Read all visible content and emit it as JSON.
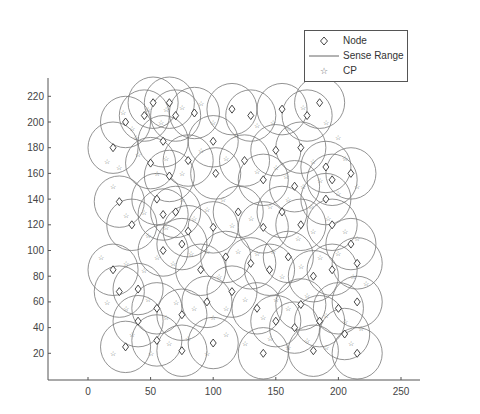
{
  "chart_data": {
    "type": "scatter",
    "title": "",
    "xlabel": "",
    "ylabel": "",
    "xlim": [
      -31,
      265
    ],
    "ylim": [
      0,
      235
    ],
    "grid": false,
    "legend_position": "top-right",
    "x_ticks": [
      0,
      50,
      100,
      150,
      200,
      250
    ],
    "y_ticks": [
      20,
      40,
      60,
      80,
      100,
      120,
      140,
      160,
      180,
      200,
      220
    ],
    "sense_range_radius": 20,
    "legend": [
      {
        "label": "Node",
        "marker": "diamond"
      },
      {
        "label": "Sense Range",
        "marker": "line"
      },
      {
        "label": "CP",
        "marker": "star"
      }
    ],
    "series": [
      {
        "name": "Node",
        "marker": "diamond",
        "points": [
          [
            30,
            200
          ],
          [
            45,
            205
          ],
          [
            52,
            215
          ],
          [
            65,
            215
          ],
          [
            70,
            205
          ],
          [
            60,
            185
          ],
          [
            85,
            207
          ],
          [
            20,
            180
          ],
          [
            50,
            168
          ],
          [
            65,
            158
          ],
          [
            80,
            170
          ],
          [
            100,
            185
          ],
          [
            102,
            160
          ],
          [
            115,
            210
          ],
          [
            130,
            205
          ],
          [
            155,
            210
          ],
          [
            175,
            205
          ],
          [
            185,
            215
          ],
          [
            150,
            178
          ],
          [
            170,
            180
          ],
          [
            190,
            165
          ],
          [
            125,
            170
          ],
          [
            140,
            155
          ],
          [
            165,
            150
          ],
          [
            195,
            155
          ],
          [
            210,
            160
          ],
          [
            190,
            140
          ],
          [
            25,
            138
          ],
          [
            35,
            120
          ],
          [
            55,
            140
          ],
          [
            60,
            128
          ],
          [
            70,
            130
          ],
          [
            80,
            115
          ],
          [
            100,
            118
          ],
          [
            120,
            130
          ],
          [
            140,
            118
          ],
          [
            155,
            130
          ],
          [
            170,
            120
          ],
          [
            195,
            120
          ],
          [
            210,
            105
          ],
          [
            20,
            85
          ],
          [
            40,
            70
          ],
          [
            25,
            68
          ],
          [
            60,
            100
          ],
          [
            75,
            105
          ],
          [
            90,
            85
          ],
          [
            110,
            95
          ],
          [
            130,
            90
          ],
          [
            145,
            85
          ],
          [
            160,
            95
          ],
          [
            180,
            80
          ],
          [
            195,
            85
          ],
          [
            215,
            90
          ],
          [
            40,
            45
          ],
          [
            55,
            55
          ],
          [
            75,
            50
          ],
          [
            95,
            60
          ],
          [
            115,
            68
          ],
          [
            135,
            55
          ],
          [
            150,
            45
          ],
          [
            170,
            58
          ],
          [
            185,
            45
          ],
          [
            200,
            55
          ],
          [
            215,
            60
          ],
          [
            30,
            25
          ],
          [
            55,
            30
          ],
          [
            75,
            22
          ],
          [
            100,
            28
          ],
          [
            140,
            20
          ],
          [
            165,
            40
          ],
          [
            180,
            22
          ],
          [
            215,
            20
          ],
          [
            205,
            35
          ]
        ]
      },
      {
        "name": "Sense Range",
        "marker": "circle-outline",
        "note": "one circle of radius 20 centered on each Node"
      },
      {
        "name": "CP",
        "marker": "star",
        "points": [
          [
            28,
            208
          ],
          [
            35,
            195
          ],
          [
            38,
            188
          ],
          [
            48,
            210
          ],
          [
            58,
            200
          ],
          [
            62,
            210
          ],
          [
            75,
            212
          ],
          [
            90,
            215
          ],
          [
            100,
            200
          ],
          [
            15,
            170
          ],
          [
            25,
            165
          ],
          [
            40,
            175
          ],
          [
            55,
            160
          ],
          [
            62,
            172
          ],
          [
            75,
            160
          ],
          [
            90,
            178
          ],
          [
            110,
            172
          ],
          [
            118,
            190
          ],
          [
            135,
            198
          ],
          [
            148,
            200
          ],
          [
            160,
            195
          ],
          [
            172,
            212
          ],
          [
            190,
            200
          ],
          [
            200,
            188
          ],
          [
            180,
            170
          ],
          [
            205,
            172
          ],
          [
            215,
            150
          ],
          [
            135,
            162
          ],
          [
            150,
            165
          ],
          [
            158,
            158
          ],
          [
            172,
            150
          ],
          [
            185,
            155
          ],
          [
            200,
            145
          ],
          [
            178,
            135
          ],
          [
            192,
            125
          ],
          [
            20,
            150
          ],
          [
            30,
            128
          ],
          [
            45,
            130
          ],
          [
            48,
            112
          ],
          [
            62,
            118
          ],
          [
            75,
            140
          ],
          [
            85,
            125
          ],
          [
            95,
            132
          ],
          [
            108,
            140
          ],
          [
            115,
            120
          ],
          [
            130,
            125
          ],
          [
            145,
            135
          ],
          [
            160,
            140
          ],
          [
            168,
            110
          ],
          [
            180,
            115
          ],
          [
            205,
            115
          ],
          [
            215,
            110
          ],
          [
            10,
            95
          ],
          [
            30,
            90
          ],
          [
            45,
            85
          ],
          [
            55,
            95
          ],
          [
            68,
            90
          ],
          [
            82,
            98
          ],
          [
            95,
            100
          ],
          [
            105,
            80
          ],
          [
            120,
            100
          ],
          [
            135,
            98
          ],
          [
            148,
            100
          ],
          [
            155,
            80
          ],
          [
            170,
            88
          ],
          [
            185,
            95
          ],
          [
            200,
            98
          ],
          [
            212,
            80
          ],
          [
            222,
            75
          ],
          [
            15,
            60
          ],
          [
            30,
            55
          ],
          [
            48,
            62
          ],
          [
            62,
            48
          ],
          [
            70,
            60
          ],
          [
            85,
            55
          ],
          [
            100,
            48
          ],
          [
            110,
            55
          ],
          [
            125,
            62
          ],
          [
            140,
            48
          ],
          [
            150,
            62
          ],
          [
            160,
            55
          ],
          [
            175,
            65
          ],
          [
            190,
            50
          ],
          [
            205,
            45
          ],
          [
            218,
            40
          ],
          [
            20,
            20
          ],
          [
            35,
            35
          ],
          [
            50,
            20
          ],
          [
            65,
            28
          ],
          [
            80,
            32
          ],
          [
            95,
            20
          ],
          [
            110,
            35
          ],
          [
            125,
            28
          ],
          [
            145,
            32
          ],
          [
            160,
            25
          ],
          [
            175,
            30
          ],
          [
            190,
            25
          ],
          [
            210,
            28
          ]
        ]
      }
    ]
  },
  "legend": {
    "items": [
      {
        "label": "Node"
      },
      {
        "label": "Sense Range"
      },
      {
        "label": "CP"
      }
    ]
  },
  "axes": {
    "x_tick_labels": [
      "0",
      "50",
      "100",
      "150",
      "200",
      "250"
    ],
    "y_tick_labels": [
      "20",
      "40",
      "60",
      "80",
      "100",
      "120",
      "140",
      "160",
      "180",
      "200",
      "220"
    ]
  }
}
